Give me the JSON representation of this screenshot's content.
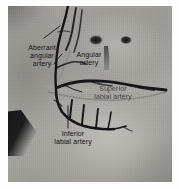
{
  "figure": {
    "kind": "anatomical-photograph",
    "modality": "grayscale photograph with dissected / injected arteries",
    "frame_color": "#ffffff",
    "skin_tone": "#a3a19b",
    "vessel_color": "#1a1a1c",
    "leader_line_color": "#111111",
    "label_color": "#141414"
  },
  "annotations": [
    {
      "id": "aberrant-angular-artery",
      "lines": [
        "Aberrant",
        "angular",
        "artery"
      ],
      "line1": "Aberrant",
      "line2": "angular",
      "line3": "artery"
    },
    {
      "id": "angular-artery",
      "lines": [
        "Angular",
        "artery"
      ],
      "line1": "Angular",
      "line2": "artery"
    },
    {
      "id": "superior-labial-artery",
      "lines": [
        "Superior",
        "labial artery"
      ],
      "line1": "Superior",
      "line2": "labial artery"
    },
    {
      "id": "inferior-labial-artery",
      "lines": [
        "Inferior",
        "labial artery"
      ],
      "line1": "Inferior",
      "line2": "labial artery"
    }
  ]
}
